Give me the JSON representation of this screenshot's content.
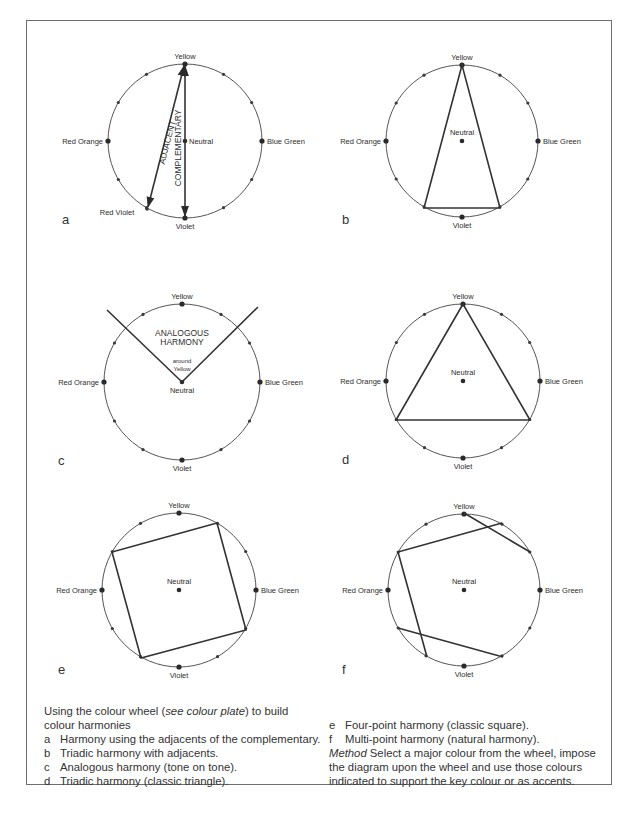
{
  "caption": {
    "intro_before": "Using the colour wheel (",
    "intro_italic": "see colour plate",
    "intro_after": ") to build",
    "intro_line2": "colour harmonies",
    "items": [
      {
        "letter": "a",
        "text": "Harmony using the adjacents of the complementary."
      },
      {
        "letter": "b",
        "text": "Triadic harmony with adjacents."
      },
      {
        "letter": "c",
        "text": "Analogous harmony (tone on tone)."
      },
      {
        "letter": "d",
        "text": "Triadic harmony (classic triangle)."
      },
      {
        "letter": "e",
        "text": "Four-point harmony (classic square)."
      },
      {
        "letter": "f",
        "text": "Multi-point harmony (natural harmony)."
      }
    ],
    "method_label": "Method",
    "method_text": " Select a major colour from the wheel, impose",
    "method_line2": "the diagram upon the wheel and use those colours",
    "method_line3": "indicated to support the key colour or as accents."
  },
  "wheel_labels": {
    "top": "Yellow",
    "right": "Blue Green",
    "bottom": "Violet",
    "left": "Red Orange",
    "center": "Neutral",
    "red_violet": "Red Violet"
  },
  "panels": [
    {
      "id": "a",
      "letter": "a",
      "cx": 185,
      "cy": 141,
      "r": 77,
      "letter_x": 62,
      "letter_y": 224,
      "annotations": {
        "adjacent": "ADJACENT",
        "complementary": "COMPLEMENTARY"
      }
    },
    {
      "id": "b",
      "letter": "b",
      "cx": 462,
      "cy": 141,
      "r": 76,
      "letter_x": 342,
      "letter_y": 224
    },
    {
      "id": "c",
      "letter": "c",
      "cx": 182,
      "cy": 382,
      "r": 78,
      "letter_x": 58,
      "letter_y": 465,
      "annotations": {
        "title1": "ANALOGOUS",
        "title2": "HARMONY",
        "sub1": "around",
        "sub2": "Yellow"
      }
    },
    {
      "id": "d",
      "letter": "d",
      "cx": 463,
      "cy": 381,
      "r": 77,
      "letter_x": 342,
      "letter_y": 464
    },
    {
      "id": "e",
      "letter": "e",
      "cx": 179,
      "cy": 590,
      "r": 77,
      "letter_x": 58,
      "letter_y": 674
    },
    {
      "id": "f",
      "letter": "f",
      "cx": 464,
      "cy": 590,
      "r": 76,
      "letter_x": 342,
      "letter_y": 674
    }
  ]
}
